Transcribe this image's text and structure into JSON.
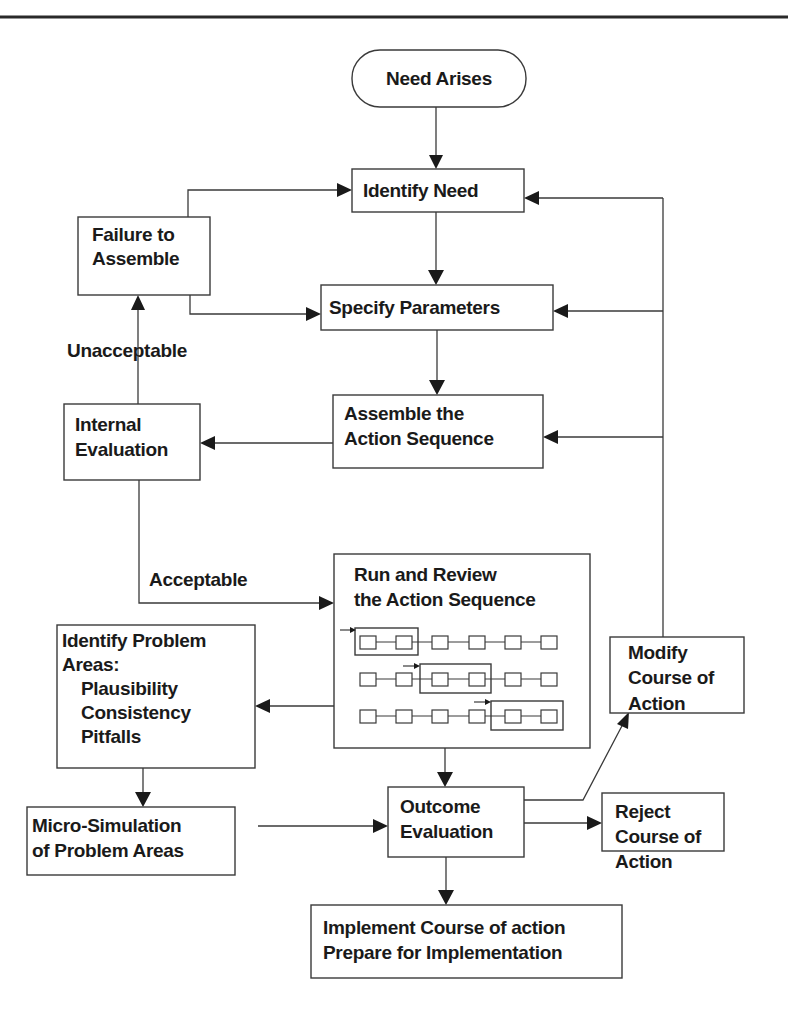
{
  "diagram": {
    "title": "",
    "nodes": {
      "need_arises": {
        "lines": [
          "Need Arises"
        ],
        "shape": "terminator"
      },
      "identify_need": {
        "lines": [
          "Identify Need"
        ],
        "shape": "process"
      },
      "failure_to_assemble": {
        "lines": [
          "Failure to",
          "Assemble"
        ],
        "shape": "process"
      },
      "specify_parameters": {
        "lines": [
          "Specify Parameters"
        ],
        "shape": "process"
      },
      "internal_evaluation": {
        "lines": [
          "Internal",
          "Evaluation"
        ],
        "shape": "process"
      },
      "assemble_sequence": {
        "lines": [
          "Assemble the",
          "Action Sequence"
        ],
        "shape": "process"
      },
      "run_review": {
        "lines": [
          "Run and Review",
          "the Action Sequence"
        ],
        "shape": "process"
      },
      "identify_problem_areas": {
        "lines": [
          "Identify Problem",
          "Areas:",
          "Plausibility",
          "Consistency",
          "Pitfalls"
        ],
        "shape": "process"
      },
      "modify_course": {
        "lines": [
          "Modify",
          "Course of",
          "Action"
        ],
        "shape": "process"
      },
      "micro_simulation": {
        "lines": [
          "Micro-Simulation",
          "of Problem Areas"
        ],
        "shape": "process"
      },
      "outcome_evaluation": {
        "lines": [
          "Outcome",
          "Evaluation"
        ],
        "shape": "process"
      },
      "reject_course": {
        "lines": [
          "Reject",
          "Course of",
          "Action"
        ],
        "shape": "process"
      },
      "implement": {
        "lines": [
          "Implement Course of action",
          "Prepare for Implementation"
        ],
        "shape": "process"
      }
    },
    "edge_labels": {
      "unacceptable": "Unacceptable",
      "acceptable": "Acceptable"
    },
    "edges": [
      {
        "from": "need_arises",
        "to": "identify_need"
      },
      {
        "from": "identify_need",
        "to": "specify_parameters"
      },
      {
        "from": "specify_parameters",
        "to": "assemble_sequence"
      },
      {
        "from": "assemble_sequence",
        "to": "internal_evaluation"
      },
      {
        "from": "internal_evaluation",
        "to": "failure_to_assemble",
        "label": "Unacceptable"
      },
      {
        "from": "failure_to_assemble",
        "to": "identify_need"
      },
      {
        "from": "failure_to_assemble",
        "to": "specify_parameters"
      },
      {
        "from": "internal_evaluation",
        "to": "run_review",
        "label": "Acceptable"
      },
      {
        "from": "run_review",
        "to": "identify_problem_areas"
      },
      {
        "from": "identify_problem_areas",
        "to": "micro_simulation"
      },
      {
        "from": "micro_simulation",
        "to": "outcome_evaluation"
      },
      {
        "from": "run_review",
        "to": "outcome_evaluation"
      },
      {
        "from": "outcome_evaluation",
        "to": "modify_course"
      },
      {
        "from": "outcome_evaluation",
        "to": "reject_course"
      },
      {
        "from": "outcome_evaluation",
        "to": "implement"
      },
      {
        "from": "modify_course",
        "to": "identify_need"
      },
      {
        "from": "modify_course",
        "to": "specify_parameters"
      },
      {
        "from": "modify_course",
        "to": "assemble_sequence"
      }
    ],
    "sequence_illustration": {
      "rows": 3,
      "steps_per_row": 6,
      "highlight_windows": [
        [
          1,
          2
        ],
        [
          3,
          4
        ],
        [
          5,
          6
        ]
      ]
    }
  }
}
